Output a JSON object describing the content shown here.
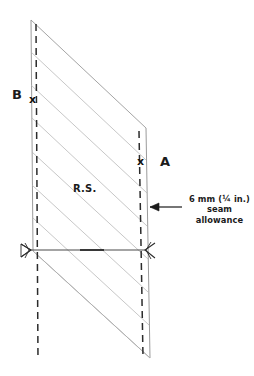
{
  "diagram": {
    "type": "sewing-pattern-illustration",
    "background_color": "#ffffff",
    "ink_color": "#1b1b1b",
    "line_color": "#8a8a8a",
    "labels": {
      "point_b": "B",
      "point_a": "A",
      "right_side": "R.S.",
      "mark_b": "x",
      "mark_a": "x"
    },
    "callout": {
      "line1": "6 mm (¼ in.)",
      "line2": "seam",
      "line3": "allowance",
      "full_text": "6 mm (¼ in.) seam allowance",
      "measurement_metric": "6 mm",
      "measurement_imperial": "¼ in."
    },
    "geometry": {
      "top_left": [
        31,
        20
      ],
      "top_right": [
        146,
        128
      ],
      "bottom_left": [
        31,
        250
      ],
      "bottom_right": [
        150,
        358
      ],
      "left_seam_dashed_x": 37,
      "right_seam_dashed_x": 140,
      "fold_line_y": 250,
      "diagonal_count": 7
    },
    "annotations": {
      "fold_arrow_left": "arrowhead-left",
      "fold_arrow_right": "arrowhead-right",
      "callout_arrow": "arrowhead-left"
    }
  }
}
